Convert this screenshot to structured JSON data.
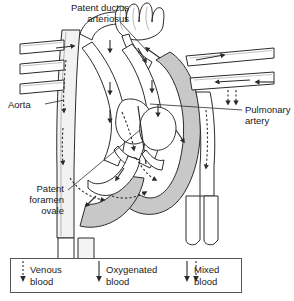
{
  "figure": {
    "type": "anatomical-diagram",
    "labels": [
      {
        "id": "patent-ductus-arteriosus",
        "text": "Patent ductus\narteriosus",
        "align": "right",
        "x": 47,
        "y": 2
      },
      {
        "id": "aorta",
        "text": "Aorta",
        "align": "left",
        "x": 8,
        "y": 99
      },
      {
        "id": "pulmonary-artery",
        "text": "Pulmonary\nartery",
        "align": "left",
        "x": 243,
        "y": 104
      },
      {
        "id": "patent-foramen-ovale",
        "text": "Patent\nforamen\novale",
        "align": "right",
        "x": 16,
        "y": 183
      }
    ]
  },
  "legend": {
    "items": [
      {
        "id": "venous-blood",
        "label": "Venous\nblood",
        "arrows": [
          "dotted"
        ],
        "x": 18
      },
      {
        "id": "oxygenated-blood",
        "label": "Oxygenated\nblood",
        "arrows": [
          "solid"
        ],
        "x": 100
      },
      {
        "id": "mixed-blood",
        "label": "Mixed\nblood",
        "arrows": [
          "solid",
          "dotted"
        ],
        "x": 190
      }
    ],
    "divider_color": "#555555",
    "border_color": "#555555"
  },
  "colors": {
    "outline": "#2b2b2b",
    "vessel_fill": "#ffffff",
    "shaded_fill": "#c8c8c8",
    "light_fill": "#e8e8e8",
    "label_text": "#1a1a1a"
  }
}
